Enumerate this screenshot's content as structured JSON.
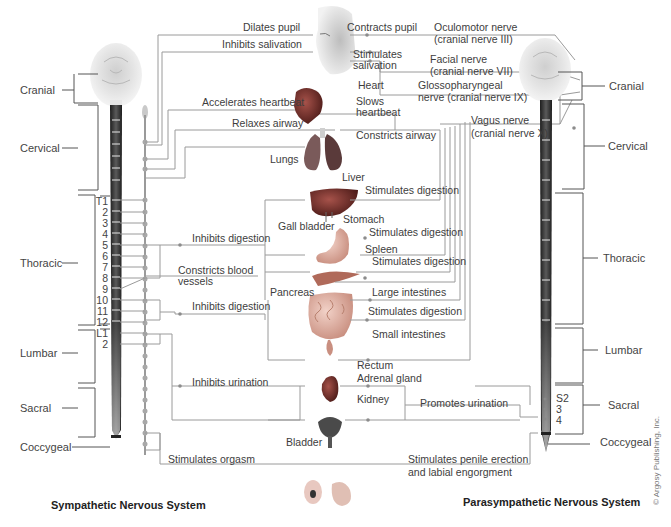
{
  "titles": {
    "left": "Sympathetic Nervous System",
    "right": "Parasympathetic Nervous System"
  },
  "copyright": "© Argosy Publishing, Inc.",
  "segments_left": [
    "Cranial",
    "Cervical",
    "Thoracic",
    "Lumbar",
    "Sacral",
    "Coccygeal"
  ],
  "segments_right": [
    "Cranial",
    "Cervical",
    "Thoracic",
    "Lumbar",
    "Sacral",
    "Coccygeal"
  ],
  "vertebra_labels": [
    "T1",
    "2",
    "3",
    "4",
    "5",
    "6",
    "7",
    "8",
    "9",
    "10",
    "11",
    "12",
    "L1",
    "2"
  ],
  "sacral_labels": [
    "S2",
    "3",
    "4"
  ],
  "sympathetic_effects": {
    "dilates_pupil": "Dilates pupil",
    "inhibits_salivation": "Inhibits salivation",
    "accelerates_heartbeat": "Accelerates heartbeat",
    "relaxes_airway": "Relaxes airway",
    "inhibits_digestion_1": "Inhibits digestion",
    "constricts_blood_vessels_1": "Constricts blood",
    "constricts_blood_vessels_2": "vessels",
    "inhibits_digestion_2": "Inhibits digestion",
    "inhibits_urination": "Inhibits urination",
    "stimulates_orgasm": "Stimulates orgasm"
  },
  "parasympathetic_effects": {
    "contracts_pupil": "Contracts pupil",
    "stimulates_salivation_1": "Stimulates",
    "stimulates_salivation_2": "salivation",
    "slows_heartbeat_1": "Slows",
    "slows_heartbeat_2": "heartbeat",
    "constricts_airway": "Constricts airway",
    "stimulates_digestion_liver": "Stimulates digestion",
    "stimulates_digestion_stomach": "Stimulates digestion",
    "stimulates_digestion_spleen": "Stimulates digestion",
    "stimulates_digestion_intestines": "Stimulates digestion",
    "promotes_urination": "Promotes urination",
    "stimulates_erection_1": "Stimulates penile erection",
    "stimulates_erection_2": "and labial engorgment"
  },
  "nerves": {
    "oculomotor_1": "Oculomotor nerve",
    "oculomotor_2": "(cranial nerve III)",
    "facial_1": "Facial nerve",
    "facial_2": "(cranial nerve VII)",
    "glosso_1": "Glossopharyngeal",
    "glosso_2": "nerve (cranial nerve IX)",
    "vagus_1": "Vagus nerve",
    "vagus_2": "(cranial nerve X)"
  },
  "organs": {
    "heart": "Heart",
    "lungs": "Lungs",
    "liver": "Liver",
    "gall_bladder": "Gall bladder",
    "stomach": "Stomach",
    "spleen": "Spleen",
    "pancreas": "Pancreas",
    "large_intestines": "Large intestines",
    "small_intestines": "Small intestines",
    "rectum": "Rectum",
    "adrenal_gland": "Adrenal gland",
    "kidney": "Kidney",
    "bladder": "Bladder"
  },
  "colors": {
    "line": "#9a9a9a",
    "text": "#3d3d3d",
    "spine_dark": "#2b2b2b",
    "spine_light": "#d8d8d8",
    "organ_red": "#7a2e2a"
  }
}
